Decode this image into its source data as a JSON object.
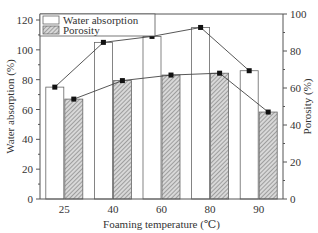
{
  "chart_data": {
    "type": "bar",
    "title": "",
    "xlabel": "Foaming temperature (℃)",
    "ylabel": "Water absorption (%)",
    "ylabel_right": "Porosity (%)",
    "categories": [
      "25",
      "40",
      "60",
      "80",
      "90"
    ],
    "ylim": [
      0,
      120
    ],
    "ylim_right": [
      0,
      100
    ],
    "yticks": [
      0,
      20,
      40,
      60,
      80,
      100,
      120
    ],
    "yticks_right": [
      0,
      20,
      40,
      60,
      80,
      100
    ],
    "grid": false,
    "legend_position": "upper-left inside",
    "series": [
      {
        "name": "Water absorption",
        "axis": "left",
        "style": "open bar + line with square markers",
        "values": [
          75,
          105,
          109,
          115,
          86
        ]
      },
      {
        "name": "Porosity",
        "axis": "right",
        "style": "hatched bar + line with square markers",
        "values": [
          54,
          64,
          67,
          68,
          47
        ]
      }
    ]
  },
  "legend": {
    "items": [
      {
        "label": "Water absorption",
        "swatch": "open"
      },
      {
        "label": "Porosity",
        "swatch": "hatched"
      }
    ]
  },
  "colors": {
    "axis": "#555555",
    "bar_outline": "#666666",
    "hatch": "#777777",
    "marker": "#111111",
    "line": "#444444"
  }
}
